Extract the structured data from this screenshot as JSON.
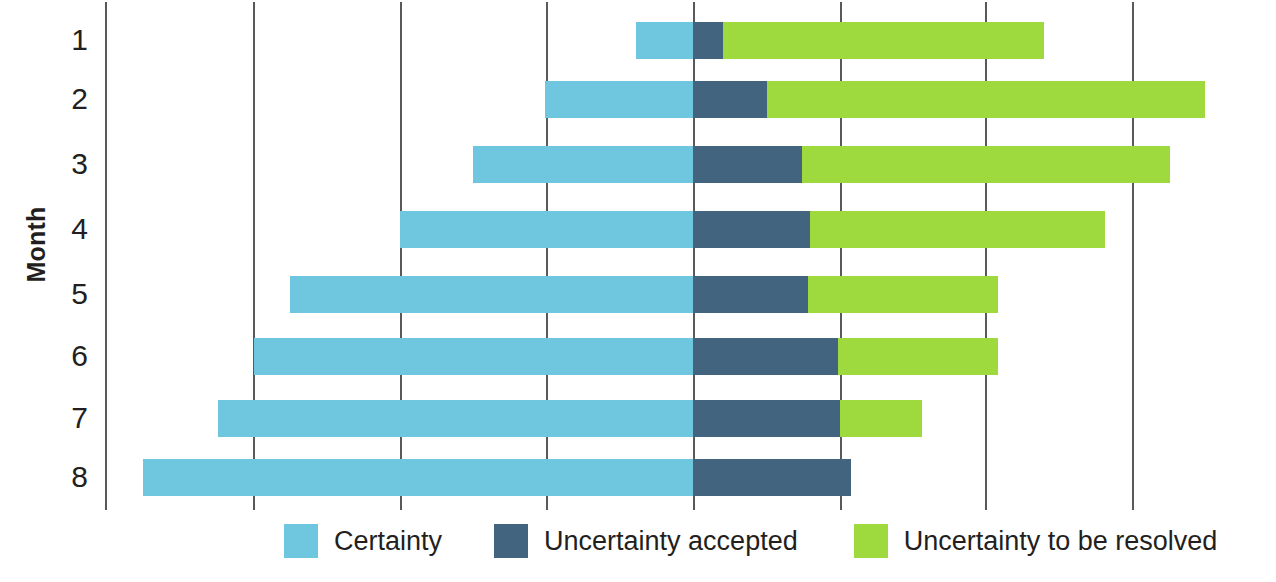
{
  "chart_data": {
    "type": "bar",
    "subtype": "stacked-horizontal",
    "title": "",
    "xlabel": "",
    "ylabel": "Month",
    "orientation": "horizontal",
    "stacked": true,
    "grid": true,
    "grid_axis": "x",
    "legend_position": "bottom",
    "categories": [
      "1",
      "2",
      "3",
      "4",
      "5",
      "6",
      "7",
      "8"
    ],
    "x_axis": {
      "tick_labels": [],
      "gridline_positions_px": [
        105,
        253,
        400,
        546,
        693,
        840,
        985,
        1132
      ],
      "zero_reference_px": 693,
      "units_per_gridline": 1
    },
    "series": [
      {
        "name": "Certainty",
        "color": "#6ec6df",
        "values": [
          1.0,
          2.0,
          3.0,
          4.0,
          5.0,
          6.0,
          6.5,
          7.5
        ]
      },
      {
        "name": "Uncertainty accepted",
        "color": "#42647f",
        "values": [
          0.5,
          1.25,
          1.9,
          2.0,
          2.0,
          2.5,
          2.5,
          2.7
        ]
      },
      {
        "name": "Uncertainty to be resolved",
        "color": "#9ed93e",
        "values": [
          5.5,
          7.5,
          6.2,
          5.0,
          3.2,
          2.7,
          1.4,
          0.0
        ]
      }
    ],
    "bars_px": [
      {
        "month": "1",
        "y": 22,
        "certainty_start": 636,
        "accepted_start": 693,
        "resolved_start": 723,
        "end": 1044
      },
      {
        "month": "2",
        "y": 81,
        "certainty_start": 545,
        "accepted_start": 693,
        "resolved_start": 767,
        "end": 1205
      },
      {
        "month": "3",
        "y": 146,
        "certainty_start": 473,
        "accepted_start": 693,
        "resolved_start": 802,
        "end": 1170
      },
      {
        "month": "4",
        "y": 211,
        "certainty_start": 400,
        "accepted_start": 693,
        "resolved_start": 810,
        "end": 1105
      },
      {
        "month": "5",
        "y": 276,
        "certainty_start": 290,
        "accepted_start": 693,
        "resolved_start": 808,
        "end": 998
      },
      {
        "month": "6",
        "y": 338,
        "certainty_start": 254,
        "accepted_start": 693,
        "resolved_start": 838,
        "end": 998
      },
      {
        "month": "7",
        "y": 400,
        "certainty_start": 218,
        "accepted_start": 693,
        "resolved_start": 840,
        "end": 922
      },
      {
        "month": "8",
        "y": 459,
        "certainty_start": 143,
        "accepted_start": 693,
        "resolved_start": 851,
        "end": 851
      }
    ],
    "legend": [
      {
        "label": "Certainty",
        "color": "#6ec6df"
      },
      {
        "label": "Uncertainty accepted",
        "color": "#42647f"
      },
      {
        "label": "Uncertainty to be resolved",
        "color": "#9ed93e"
      }
    ]
  },
  "axis": {
    "y_title": "Month"
  },
  "colors": {
    "certainty": "#6ec6df",
    "uncertainty_accepted": "#42647f",
    "uncertainty_resolved": "#9ed93e",
    "gridline": "#58595b",
    "text": "#231f20",
    "background": "#ffffff"
  }
}
